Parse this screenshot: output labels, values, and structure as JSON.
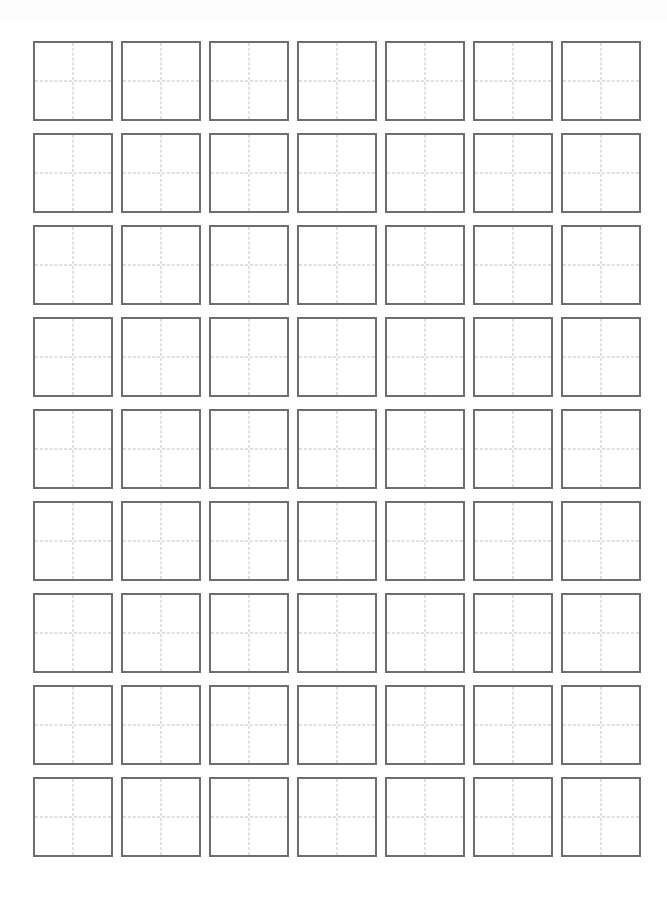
{
  "document": {
    "title": "Chinese Character Practice Grid Worksheet",
    "page_width": 667,
    "page_height": 916,
    "background_color": "#ffffff"
  },
  "grid": {
    "name": "tian-zi-ge-practice-grid",
    "columns": 7,
    "rows": 9,
    "total_cells": 63,
    "cell_width": 80,
    "cell_height": 80,
    "column_gap": 8,
    "row_gap": 12,
    "origin_x": 33,
    "origin_y": 41,
    "border_color": "#6e6e6e",
    "border_width": 2,
    "guide_color": "#c0c0c0",
    "guide_style": "dashed",
    "guide_width": 1,
    "cell_fill": "#ffffff"
  },
  "cells": [
    {
      "row": 1,
      "col": 1,
      "text": ""
    },
    {
      "row": 1,
      "col": 2,
      "text": ""
    },
    {
      "row": 1,
      "col": 3,
      "text": ""
    },
    {
      "row": 1,
      "col": 4,
      "text": ""
    },
    {
      "row": 1,
      "col": 5,
      "text": ""
    },
    {
      "row": 1,
      "col": 6,
      "text": ""
    },
    {
      "row": 1,
      "col": 7,
      "text": ""
    },
    {
      "row": 2,
      "col": 1,
      "text": ""
    },
    {
      "row": 2,
      "col": 2,
      "text": ""
    },
    {
      "row": 2,
      "col": 3,
      "text": ""
    },
    {
      "row": 2,
      "col": 4,
      "text": ""
    },
    {
      "row": 2,
      "col": 5,
      "text": ""
    },
    {
      "row": 2,
      "col": 6,
      "text": ""
    },
    {
      "row": 2,
      "col": 7,
      "text": ""
    },
    {
      "row": 3,
      "col": 1,
      "text": ""
    },
    {
      "row": 3,
      "col": 2,
      "text": ""
    },
    {
      "row": 3,
      "col": 3,
      "text": ""
    },
    {
      "row": 3,
      "col": 4,
      "text": ""
    },
    {
      "row": 3,
      "col": 5,
      "text": ""
    },
    {
      "row": 3,
      "col": 6,
      "text": ""
    },
    {
      "row": 3,
      "col": 7,
      "text": ""
    },
    {
      "row": 4,
      "col": 1,
      "text": ""
    },
    {
      "row": 4,
      "col": 2,
      "text": ""
    },
    {
      "row": 4,
      "col": 3,
      "text": ""
    },
    {
      "row": 4,
      "col": 4,
      "text": ""
    },
    {
      "row": 4,
      "col": 5,
      "text": ""
    },
    {
      "row": 4,
      "col": 6,
      "text": ""
    },
    {
      "row": 4,
      "col": 7,
      "text": ""
    },
    {
      "row": 5,
      "col": 1,
      "text": ""
    },
    {
      "row": 5,
      "col": 2,
      "text": ""
    },
    {
      "row": 5,
      "col": 3,
      "text": ""
    },
    {
      "row": 5,
      "col": 4,
      "text": ""
    },
    {
      "row": 5,
      "col": 5,
      "text": ""
    },
    {
      "row": 5,
      "col": 6,
      "text": ""
    },
    {
      "row": 5,
      "col": 7,
      "text": ""
    },
    {
      "row": 6,
      "col": 1,
      "text": ""
    },
    {
      "row": 6,
      "col": 2,
      "text": ""
    },
    {
      "row": 6,
      "col": 3,
      "text": ""
    },
    {
      "row": 6,
      "col": 4,
      "text": ""
    },
    {
      "row": 6,
      "col": 5,
      "text": ""
    },
    {
      "row": 6,
      "col": 6,
      "text": ""
    },
    {
      "row": 6,
      "col": 7,
      "text": ""
    },
    {
      "row": 7,
      "col": 1,
      "text": ""
    },
    {
      "row": 7,
      "col": 2,
      "text": ""
    },
    {
      "row": 7,
      "col": 3,
      "text": ""
    },
    {
      "row": 7,
      "col": 4,
      "text": ""
    },
    {
      "row": 7,
      "col": 5,
      "text": ""
    },
    {
      "row": 7,
      "col": 6,
      "text": ""
    },
    {
      "row": 7,
      "col": 7,
      "text": ""
    },
    {
      "row": 8,
      "col": 1,
      "text": ""
    },
    {
      "row": 8,
      "col": 2,
      "text": ""
    },
    {
      "row": 8,
      "col": 3,
      "text": ""
    },
    {
      "row": 8,
      "col": 4,
      "text": ""
    },
    {
      "row": 8,
      "col": 5,
      "text": ""
    },
    {
      "row": 8,
      "col": 6,
      "text": ""
    },
    {
      "row": 8,
      "col": 7,
      "text": ""
    },
    {
      "row": 9,
      "col": 1,
      "text": ""
    },
    {
      "row": 9,
      "col": 2,
      "text": ""
    },
    {
      "row": 9,
      "col": 3,
      "text": ""
    },
    {
      "row": 9,
      "col": 4,
      "text": ""
    },
    {
      "row": 9,
      "col": 5,
      "text": ""
    },
    {
      "row": 9,
      "col": 6,
      "text": ""
    },
    {
      "row": 9,
      "col": 7,
      "text": ""
    }
  ]
}
